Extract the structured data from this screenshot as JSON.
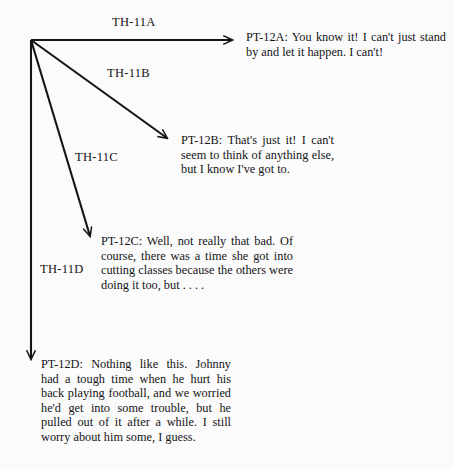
{
  "diagram": {
    "background_color": "#fbfbfc",
    "ink_color": "#141414",
    "origin": {
      "x": 31,
      "y": 40
    },
    "branches": [
      {
        "label": "TH-11A",
        "arrow": {
          "x1": 31,
          "y1": 40,
          "x2": 237,
          "y2": 40
        },
        "response_id": "PT-12A",
        "response_text": "PT-12A: You know it! I can't just stand by and let it happen. I can't!"
      },
      {
        "label": "TH-11B",
        "arrow": {
          "x1": 31,
          "y1": 40,
          "x2": 172,
          "y2": 142
        },
        "response_id": "PT-12B",
        "response_text": "PT-12B: That's just it! I can't seem to think of anything else, but I know I've got to."
      },
      {
        "label": "TH-11C",
        "arrow": {
          "x1": 31,
          "y1": 40,
          "x2": 92,
          "y2": 243
        },
        "response_id": "PT-12C",
        "response_text": "PT-12C: Well, not really that bad. Of course, there was a time she got into cutting classes because the others were doing it too, but . . . ."
      },
      {
        "label": "TH-11D",
        "arrow": {
          "x1": 31,
          "y1": 40,
          "x2": 31,
          "y2": 366
        },
        "response_id": "PT-12D",
        "response_text": "PT-12D: Nothing like this. Johnny had a tough time when he hurt his back playing football, and we worried he'd get into some trouble, but he pulled out of it after a while. I still worry about him some, I guess."
      }
    ]
  }
}
